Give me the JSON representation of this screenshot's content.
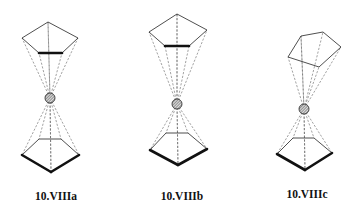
{
  "figure": {
    "structures": [
      {
        "id": "a",
        "label": "10.VIIIa",
        "description": "eclipsed sandwich, parallel rings",
        "metal": {
          "cx": 50,
          "cy": 98,
          "r": 5
        },
        "top_ring": [
          [
            48,
            22
          ],
          [
            78,
            38
          ],
          [
            62,
            53
          ],
          [
            39,
            53
          ],
          [
            22,
            38
          ]
        ],
        "top_thick_edge": [
          [
            39,
            53
          ],
          [
            62,
            53
          ]
        ],
        "bottom_ring": [
          [
            39,
            139
          ],
          [
            61,
            139
          ],
          [
            79,
            155
          ],
          [
            51,
            172
          ],
          [
            22,
            155
          ]
        ],
        "bottom_thick_edges": [
          [
            [
              22,
              155
            ],
            [
              51,
              172
            ]
          ],
          [
            [
              51,
              172
            ],
            [
              79,
              155
            ]
          ]
        ],
        "label_pos": [
          56,
          200
        ]
      },
      {
        "id": "b",
        "label": "10.VIIIb",
        "description": "staggered sandwich, parallel rings",
        "metal": {
          "cx": 177,
          "cy": 104,
          "r": 5
        },
        "top_ring": [
          [
            177,
            14
          ],
          [
            207,
            30
          ],
          [
            189,
            46
          ],
          [
            165,
            46
          ],
          [
            149,
            32
          ]
        ],
        "top_thick_edge": [
          [
            165,
            46
          ],
          [
            189,
            46
          ]
        ],
        "bottom_ring": [
          [
            166,
            133
          ],
          [
            188,
            133
          ],
          [
            207,
            149
          ],
          [
            178,
            165
          ],
          [
            150,
            150
          ]
        ],
        "bottom_thick_edges": [
          [
            [
              150,
              150
            ],
            [
              178,
              165
            ]
          ],
          [
            [
              178,
              165
            ],
            [
              207,
              149
            ]
          ]
        ],
        "label_pos": [
          182,
          200
        ]
      },
      {
        "id": "c",
        "label": "10.VIIIc",
        "description": "bent sandwich, tilted upper ring",
        "metal": {
          "cx": 304,
          "cy": 109,
          "r": 5
        },
        "top_ring": [
          [
            301,
            36
          ],
          [
            323,
            32
          ],
          [
            341,
            47
          ],
          [
            319,
            67
          ],
          [
            288,
            57
          ]
        ],
        "top_thick_edge": null,
        "bottom_ring": [
          [
            293,
            138
          ],
          [
            314,
            138
          ],
          [
            332,
            153
          ],
          [
            305,
            170
          ],
          [
            277,
            154
          ]
        ],
        "bottom_thick_edges": [
          [
            [
              277,
              154
            ],
            [
              305,
              170
            ]
          ],
          [
            [
              305,
              170
            ],
            [
              332,
              153
            ]
          ]
        ],
        "label_pos": [
          307,
          198
        ]
      }
    ]
  }
}
